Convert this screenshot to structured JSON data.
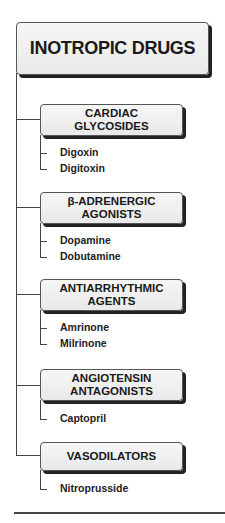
{
  "diagram": {
    "title": "INOTROPIC DRUGS",
    "categories": [
      {
        "line1": "CARDIAC",
        "line2": "GLYCOSIDES",
        "drugs": [
          "Digoxin",
          "Digitoxin"
        ]
      },
      {
        "line1": "β-ADRENERGIC",
        "line2": "AGONISTS",
        "drugs": [
          "Dopamine",
          "Dobutamine"
        ]
      },
      {
        "line1": "ANTIARRHYTHMIC",
        "line2": "AGENTS",
        "drugs": [
          "Amrinone",
          "Milrinone"
        ]
      },
      {
        "line1": "ANGIOTENSIN",
        "line2": "ANTAGONISTS",
        "drugs": [
          "Captopril"
        ]
      },
      {
        "line1": "VASODILATORS",
        "line2": "",
        "drugs": [
          "Nitroprusside"
        ]
      }
    ]
  },
  "colors": {
    "box_fill": "#eeeeee",
    "line": "#444444",
    "shadow": "#222222",
    "text": "#1a1a1a"
  }
}
